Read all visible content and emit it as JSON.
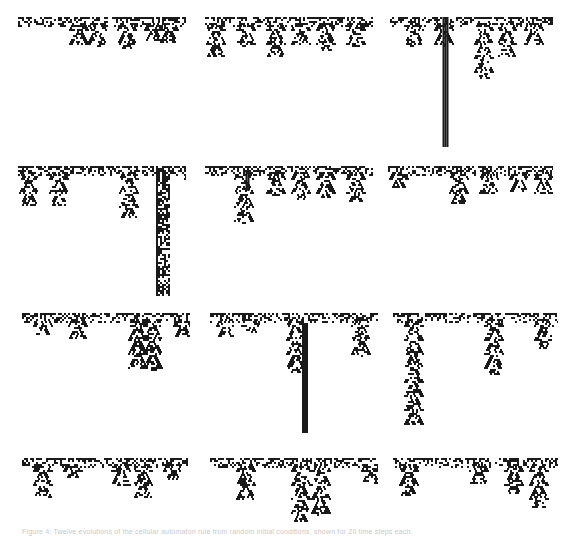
{
  "figure": {
    "caption": "Figure 4: Twelve evolutions of the cellular automaton rule from random initial conditions, shown for 20 time steps each.",
    "ink_color": "#1a1a1a",
    "background": "#ffffff",
    "panels": [
      {
        "id": 1,
        "x": 18,
        "y": 17,
        "w": 168,
        "h": 130,
        "band_w": [
          0,
          168
        ],
        "trees": [
          [
            60,
            28
          ],
          [
            78,
            30
          ],
          [
            108,
            32
          ],
          [
            150,
            26
          ],
          [
            135,
            24
          ]
        ],
        "columns": []
      },
      {
        "id": 2,
        "x": 205,
        "y": 17,
        "w": 168,
        "h": 130,
        "band_w": [
          0,
          168
        ],
        "trees": [
          [
            10,
            40
          ],
          [
            40,
            30
          ],
          [
            70,
            40
          ],
          [
            95,
            28
          ],
          [
            120,
            34
          ],
          [
            150,
            30
          ]
        ],
        "columns": []
      },
      {
        "id": 3,
        "x": 388,
        "y": 17,
        "w": 165,
        "h": 130,
        "band_w": [
          0,
          165
        ],
        "trees": [
          [
            25,
            30
          ],
          [
            55,
            30
          ],
          [
            95,
            62
          ],
          [
            118,
            40
          ],
          [
            145,
            28
          ]
        ],
        "columns": [
          [
            57,
            0,
            130,
            5
          ]
        ]
      },
      {
        "id": 4,
        "x": 18,
        "y": 166,
        "w": 168,
        "h": 130,
        "band_w": [
          0,
          168
        ],
        "trees": [
          [
            10,
            40
          ],
          [
            40,
            40
          ],
          [
            110,
            52
          ],
          [
            175,
            20
          ]
        ],
        "columns": [
          [
            145,
            0,
            130,
            14
          ]
        ]
      },
      {
        "id": 5,
        "x": 205,
        "y": 166,
        "w": 168,
        "h": 130,
        "band_w": [
          0,
          168
        ],
        "trees": [
          [
            38,
            58
          ],
          [
            70,
            30
          ],
          [
            95,
            34
          ],
          [
            120,
            32
          ],
          [
            150,
            36
          ]
        ],
        "columns": [
          [
            42,
            5,
            25,
            3
          ]
        ]
      },
      {
        "id": 6,
        "x": 388,
        "y": 166,
        "w": 165,
        "h": 130,
        "band_w": [
          0,
          165
        ],
        "trees": [
          [
            10,
            22
          ],
          [
            70,
            38
          ],
          [
            100,
            28
          ],
          [
            130,
            26
          ],
          [
            155,
            28
          ]
        ],
        "columns": []
      },
      {
        "id": 7,
        "x": 22,
        "y": 313,
        "w": 168,
        "h": 130,
        "band_w": [
          0,
          168
        ],
        "trees": [
          [
            20,
            22
          ],
          [
            55,
            26
          ],
          [
            115,
            56
          ],
          [
            130,
            58
          ],
          [
            160,
            24
          ]
        ],
        "columns": []
      },
      {
        "id": 8,
        "x": 210,
        "y": 313,
        "w": 168,
        "h": 130,
        "band_w": [
          0,
          168
        ],
        "trees": [
          [
            15,
            24
          ],
          [
            85,
            60
          ],
          [
            150,
            44
          ],
          [
            40,
            20
          ]
        ],
        "columns": [
          [
            95,
            10,
            120,
            6
          ]
        ]
      },
      {
        "id": 9,
        "x": 393,
        "y": 313,
        "w": 165,
        "h": 130,
        "band_w": [
          0,
          165
        ],
        "trees": [
          [
            20,
            112
          ],
          [
            100,
            62
          ],
          [
            150,
            36
          ],
          [
            180,
            30
          ]
        ],
        "columns": []
      },
      {
        "id": 10,
        "x": 22,
        "y": 458,
        "w": 168,
        "h": 65,
        "band_w": [
          0,
          168
        ],
        "trees": [
          [
            20,
            40
          ],
          [
            50,
            20
          ],
          [
            98,
            28
          ],
          [
            120,
            40
          ],
          [
            150,
            22
          ]
        ],
        "columns": []
      },
      {
        "id": 11,
        "x": 210,
        "y": 458,
        "w": 168,
        "h": 65,
        "band_w": [
          0,
          168
        ],
        "trees": [
          [
            35,
            42
          ],
          [
            90,
            64
          ],
          [
            110,
            58
          ],
          [
            160,
            26
          ]
        ],
        "columns": []
      },
      {
        "id": 12,
        "x": 393,
        "y": 458,
        "w": 165,
        "h": 65,
        "band_w": [
          0,
          165
        ],
        "trees": [
          [
            15,
            38
          ],
          [
            85,
            26
          ],
          [
            120,
            36
          ],
          [
            145,
            50
          ]
        ],
        "columns": []
      }
    ]
  }
}
